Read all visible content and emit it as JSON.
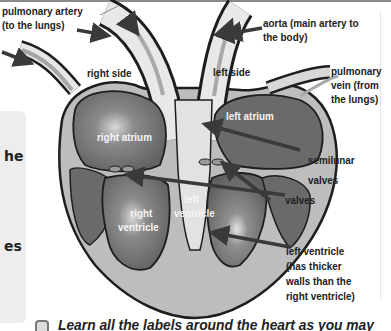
{
  "diagram": {
    "labels": {
      "pulmonary_artery": [
        "pulmonary artery",
        "(to the lungs)"
      ],
      "aorta": [
        "aorta (main artery to",
        "the body)"
      ],
      "right_side": "right side",
      "left_side": "left side",
      "pulmonary_vein": [
        "pulmonary",
        "vein (from",
        "the lungs)"
      ],
      "right_atrium": "right atrium",
      "left_atrium": "left atrium",
      "semilunar_valves": [
        "semilunar",
        "valves"
      ],
      "valves": "valves",
      "right_ventricle": [
        "right",
        "ventricle"
      ],
      "left_ventricle_inner": [
        "left",
        "ventricle"
      ],
      "left_ventricle_note": [
        "left ventricle",
        "(has thicker",
        "walls than the",
        "right ventricle)"
      ]
    },
    "colors": {
      "chamber": "#6b6b6b",
      "wall": "#bdbdbd",
      "outline": "#1e1e1e",
      "vessel": "#e8e8e8",
      "arrow": "#3a3a3a"
    }
  },
  "side_panel": {
    "fragments": [
      "he",
      "es"
    ]
  },
  "caption": {
    "text": "Learn all the labels around the heart as you may"
  }
}
